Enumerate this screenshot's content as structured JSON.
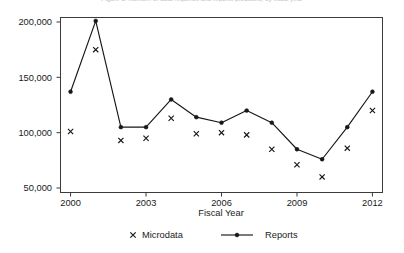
{
  "header": {
    "clipped_caption": "Figure 1. Number of data requests and reports produced, by fiscal year"
  },
  "legend": {
    "position": "bottom-center",
    "entries": [
      {
        "label": "Microdata",
        "marker": "cross",
        "color": "#171717"
      },
      {
        "label": "Reports",
        "marker": "line-dot",
        "color": "#171717"
      }
    ]
  },
  "chart_data": {
    "type": "line",
    "title": "",
    "subtitle": "",
    "xlabel": "Fiscal Year",
    "ylabel": "",
    "x": [
      2000,
      2001,
      2002,
      2003,
      2004,
      2005,
      2006,
      2007,
      2008,
      2009,
      2010,
      2011,
      2012
    ],
    "xlim": [
      1999.6,
      2012.4
    ],
    "ylim": [
      40000,
      209000
    ],
    "xticks": [
      2000,
      2003,
      2006,
      2009,
      2012
    ],
    "xtick_labels": [
      "2000",
      "2003",
      "2006",
      "2009",
      "2012"
    ],
    "yticks": [
      50000,
      100000,
      150000,
      200000
    ],
    "ytick_labels": [
      "50,000",
      "100,000",
      "150,000",
      "200,000"
    ],
    "grid": false,
    "series": [
      {
        "name": "Microdata",
        "marker": "cross",
        "line": false,
        "color": "#171717",
        "values": [
          101000,
          175000,
          93000,
          95000,
          113000,
          99000,
          100000,
          98000,
          85000,
          71000,
          60000,
          86000,
          120000
        ]
      },
      {
        "name": "Reports",
        "marker": "dot",
        "line": true,
        "color": "#171717",
        "values": [
          137000,
          201000,
          105000,
          105000,
          130000,
          114000,
          109000,
          120000,
          109000,
          85000,
          76000,
          105000,
          137000
        ]
      }
    ]
  }
}
